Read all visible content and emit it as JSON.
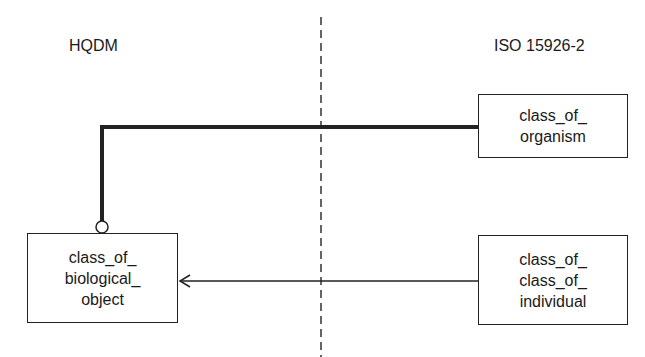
{
  "diagram": {
    "left_heading": "HQDM",
    "right_heading": "ISO 15926-2",
    "boxes": {
      "class_of_organism": {
        "lines": [
          "class_of_",
          "organism"
        ]
      },
      "class_of_class_of_individual": {
        "lines": [
          "class_of_",
          "class_of_",
          "individual"
        ]
      },
      "class_of_biological_object": {
        "lines": [
          "class_of_",
          "biological_",
          "object"
        ]
      }
    },
    "connectors": [
      {
        "from": "class_of_organism",
        "to": "class_of_biological_object",
        "style": "thick line with open circle end"
      },
      {
        "from": "class_of_class_of_individual",
        "to": "class_of_biological_object",
        "style": "thin line with open arrowhead"
      }
    ],
    "divider": {
      "style": "dashed vertical"
    }
  }
}
